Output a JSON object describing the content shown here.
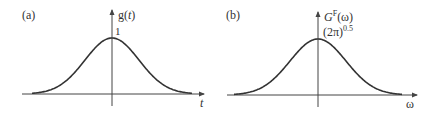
{
  "chart_data": [
    {
      "type": "line",
      "panel_label": "(a)",
      "title": "",
      "xlabel": "t",
      "ylabel": "g(t)",
      "annotations": [
        {
          "text": "1",
          "at": "peak"
        }
      ],
      "description": "Gaussian function g(t) centered at t=0 with peak value 1",
      "x": [
        -3,
        -2.5,
        -2,
        -1.5,
        -1,
        -0.5,
        0,
        0.5,
        1,
        1.5,
        2,
        2.5,
        3
      ],
      "values": [
        0.011,
        0.044,
        0.135,
        0.325,
        0.607,
        0.882,
        1,
        0.882,
        0.607,
        0.325,
        0.135,
        0.044,
        0.011
      ],
      "ylim": [
        0,
        1.3
      ],
      "grid": false,
      "ticks": "none"
    },
    {
      "type": "line",
      "panel_label": "(b)",
      "title": "",
      "xlabel": "ω",
      "ylabel": "G^F(ω)",
      "annotations": [
        {
          "text": "(2π)^0.5",
          "at": "peak"
        }
      ],
      "description": "Fourier transform of Gaussian, also Gaussian, centered at ω=0 with peak value (2π)^0.5",
      "x": [
        -3,
        -2.5,
        -2,
        -1.5,
        -1,
        -0.5,
        0,
        0.5,
        1,
        1.5,
        2,
        2.5,
        3
      ],
      "values": [
        0.028,
        0.11,
        0.339,
        0.815,
        1.52,
        2.211,
        2.507,
        2.211,
        1.52,
        0.815,
        0.339,
        0.11,
        0.028
      ],
      "ylim": [
        0,
        3.3
      ],
      "grid": false,
      "ticks": "none"
    }
  ],
  "panel_a": {
    "label": "(a)",
    "y_axis_label": "g(",
    "y_axis_var": "t",
    "y_axis_close": ")",
    "peak_label": "1",
    "x_axis_label": "t"
  },
  "panel_b": {
    "label": "(b)",
    "y_axis_label_main": "G",
    "y_axis_label_sup": "F",
    "y_axis_label_arg": "(ω)",
    "peak_label_main": "(2π)",
    "peak_label_sup": "0.5",
    "x_axis_label": "ω"
  }
}
